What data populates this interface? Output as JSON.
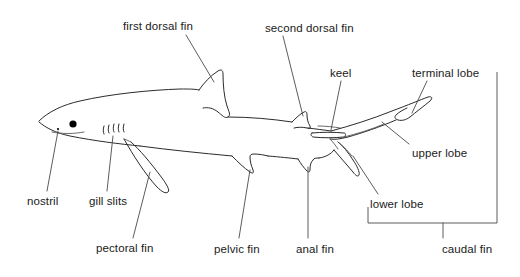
{
  "diagram": {
    "background_color": "#ffffff",
    "line_color": "#2b2b2b",
    "label_color": "#1a1a1a",
    "labels": [
      {
        "id": "first-dorsal-fin",
        "text": "first dorsal fin",
        "x": 123,
        "y": 20
      },
      {
        "id": "second-dorsal-fin",
        "text": "second dorsal fin",
        "x": 265,
        "y": 22
      },
      {
        "id": "keel",
        "text": "keel",
        "x": 330,
        "y": 67
      },
      {
        "id": "terminal-lobe",
        "text": "terminal lobe",
        "x": 412,
        "y": 67
      },
      {
        "id": "upper-lobe",
        "text": "upper lobe",
        "x": 412,
        "y": 147
      },
      {
        "id": "lower-lobe",
        "text": "lower lobe",
        "x": 370,
        "y": 198
      },
      {
        "id": "nostril",
        "text": "nostril",
        "x": 27,
        "y": 195
      },
      {
        "id": "gill-slits",
        "text": "gill slits",
        "x": 89,
        "y": 195
      },
      {
        "id": "pectoral-fin",
        "text": "pectoral fin",
        "x": 96,
        "y": 242
      },
      {
        "id": "pelvic-fin",
        "text": "pelvic fin",
        "x": 214,
        "y": 243
      },
      {
        "id": "anal-fin",
        "text": "anal fin",
        "x": 296,
        "y": 243
      },
      {
        "id": "caudal-fin",
        "text": "caudal fin",
        "x": 442,
        "y": 243
      }
    ],
    "anatomy_parts": [
      "first dorsal fin",
      "second dorsal fin",
      "keel",
      "terminal lobe",
      "upper lobe",
      "lower lobe",
      "nostril",
      "gill slits",
      "pectoral fin",
      "pelvic fin",
      "anal fin",
      "caudal fin"
    ],
    "gill_slit_count": 5,
    "eye": {
      "cx": 73,
      "cy": 124,
      "r": 3.6
    },
    "nostril_mark": {
      "cx": 58,
      "cy": 129,
      "r": 1.1
    }
  }
}
